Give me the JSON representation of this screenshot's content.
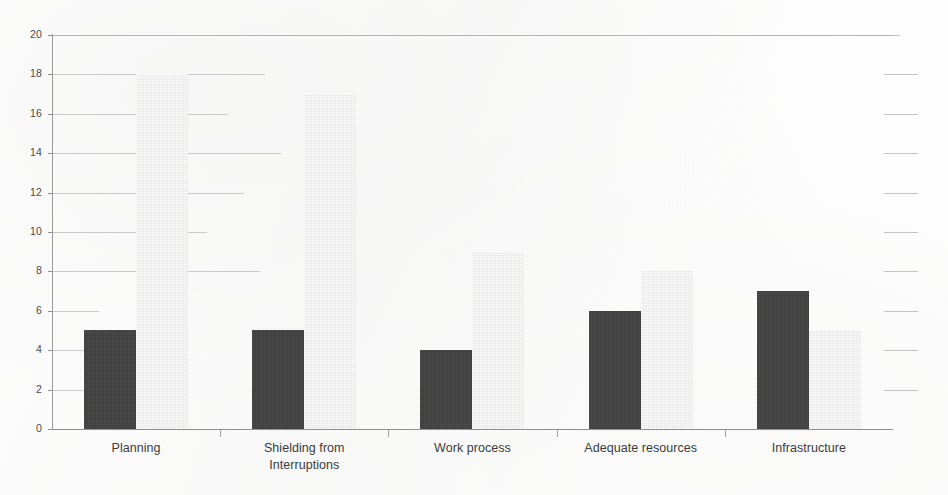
{
  "chart_data": {
    "type": "bar",
    "title": "",
    "subtitle": "",
    "xlabel": "",
    "ylabel": "",
    "categories": [
      "Planning",
      "Shielding from Interruptions",
      "Work process",
      "Adequate resources",
      "Infrastructure"
    ],
    "category_lines": [
      [
        "Planning"
      ],
      [
        "Shielding from",
        "Interruptions"
      ],
      [
        "Work process"
      ],
      [
        "Adequate resources"
      ],
      [
        "Infrastructure"
      ]
    ],
    "series": [
      {
        "name": "Series 1",
        "color": "#404040",
        "values": [
          5,
          5,
          4,
          6,
          7
        ]
      },
      {
        "name": "Series 2",
        "color": "#ededed",
        "values": [
          18,
          17,
          9,
          8,
          5
        ]
      }
    ],
    "ylim": [
      0,
      20
    ],
    "ytick_step": 2,
    "ytick_labels": [
      "0",
      "2",
      "4",
      "6",
      "8",
      "10",
      "12",
      "14",
      "16",
      "18",
      "20"
    ],
    "ytick_values": [
      0,
      2,
      4,
      6,
      8,
      10,
      12,
      14,
      16,
      18,
      20
    ],
    "grid": true,
    "grid_axis": "y",
    "legend": false,
    "legend_position": "none",
    "annotations": [],
    "background_color": "#ffffff",
    "grid_color": "#b9b9b9",
    "axis_color": "#8f8f8f",
    "tick_label_color": "#4a4a4a",
    "category_label_color": "#3b3b3b"
  },
  "figure": {
    "width": 948,
    "height": 495
  }
}
